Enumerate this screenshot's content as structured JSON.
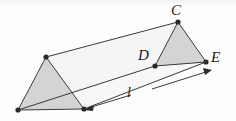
{
  "figure": {
    "kind": "triangular-prism-diagram",
    "background_color": "#fdfdfd",
    "stroke_color": "#3a3a3a",
    "face_fill_near": "#d4d4d4",
    "face_fill_top": "#ededed",
    "face_fill_side": "#f4f4f4",
    "vertex_dot_color": "#2b2b2b"
  },
  "labels": {
    "apex_top": "C",
    "base_left": "D",
    "base_right": "E",
    "length": "l"
  },
  "geometry": {
    "front_triangle": {
      "apex": [
        178,
        22
      ],
      "left": [
        155,
        66
      ],
      "right": [
        206,
        62
      ]
    },
    "back_triangle": {
      "apex": [
        46,
        57
      ],
      "left": [
        18,
        110
      ],
      "right": [
        84,
        109
      ]
    },
    "dimension_line": {
      "start": [
        84,
        109
      ],
      "end": [
        209,
        71
      ],
      "gap_start": [
        131,
        95
      ],
      "gap_end": [
        152,
        89
      ],
      "arrow_start_dir": "down-left",
      "arrow_end_dir": "down-right"
    }
  }
}
